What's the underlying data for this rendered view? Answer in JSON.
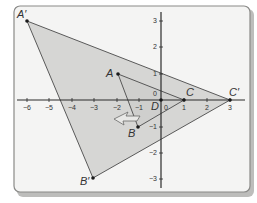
{
  "figure": {
    "type": "dilation",
    "center_label": "D",
    "scale_factor": 3,
    "colors": {
      "card_background": "#f4f4f3",
      "image_fill": "#d6d6d4",
      "line": "#4a4a4a",
      "axis": "#2a2a2a"
    }
  },
  "axes": {
    "x_ticks": [
      "−6",
      "−5",
      "−4",
      "−3",
      "−2",
      "−1",
      "0",
      "1",
      "2",
      "3"
    ],
    "y_ticks": [
      "3",
      "2",
      "1",
      "0",
      "−1",
      "−2",
      "−3"
    ],
    "x_range": [
      -6.5,
      3.5
    ],
    "y_range": [
      -3.5,
      3.5
    ]
  },
  "preimage": {
    "points": [
      {
        "label": "A",
        "x": -2,
        "y": 1
      },
      {
        "label": "B",
        "x": -1,
        "y": -1
      },
      {
        "label": "C",
        "x": 1,
        "y": 0
      }
    ]
  },
  "image": {
    "points": [
      {
        "label": "A′",
        "x": -6,
        "y": 3
      },
      {
        "label": "B′",
        "x": -3,
        "y": -3
      },
      {
        "label": "C′",
        "x": 3,
        "y": 0
      }
    ]
  },
  "center": {
    "label": "D",
    "x": 0,
    "y": 0
  },
  "arrow": {
    "direction": "left-down",
    "meaning": "enlargement-direction"
  }
}
